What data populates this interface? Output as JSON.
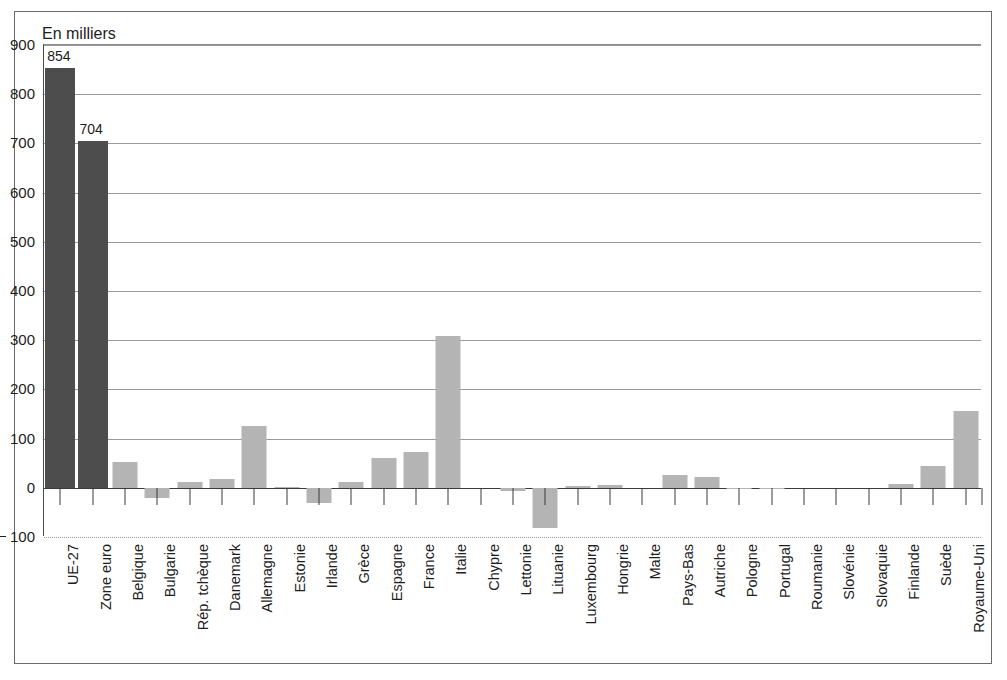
{
  "unit_caption": "En milliers",
  "colors": {
    "bar_dark": "#4d4d4d",
    "bar_light": "#b4b4b4",
    "axis": "#3b3b3b",
    "grid": "#9a9a9a",
    "frame": "#6a6a6a",
    "text": "#1d1d1d"
  },
  "chart_data": {
    "type": "bar",
    "title": "",
    "subtitle": "",
    "xlabel": "",
    "ylabel": "En milliers",
    "ylim": [
      -100,
      900
    ],
    "ytick_labels": [
      "900",
      "800",
      "700",
      "600",
      "500",
      "400",
      "300",
      "200",
      "100",
      "0",
      "100"
    ],
    "ytick_values": [
      900,
      800,
      700,
      600,
      500,
      400,
      300,
      200,
      100,
      0,
      -100
    ],
    "ytick_negative_flags": [
      false,
      false,
      false,
      false,
      false,
      false,
      false,
      false,
      false,
      false,
      true
    ],
    "grid": true,
    "legend": "none",
    "categories": [
      "UE-27",
      "Zone euro",
      "Belgique",
      "Bulgarie",
      "Rép. tchèque",
      "Danemark",
      "Allemagne",
      "Estonie",
      "Irlande",
      "Grèce",
      "Espagne",
      "France",
      "Italie",
      "Chypre",
      "Lettonie",
      "Lituanie",
      "Luxembourg",
      "Hongrie",
      "Malte",
      "Pays-Bas",
      "Autriche",
      "Pologne",
      "Portugal",
      "Roumanie",
      "Slovénie",
      "Slovaquie",
      "Finlande",
      "Suède",
      "Royaume-Uni"
    ],
    "values": [
      854,
      704,
      53,
      -21,
      11,
      18,
      126,
      1,
      -30,
      12,
      61,
      73,
      308,
      0,
      -7,
      -82,
      3,
      6,
      0,
      27,
      22,
      -3,
      -1,
      0,
      0,
      0,
      8,
      44,
      156
    ],
    "highlighted": [
      true,
      true,
      false,
      false,
      false,
      false,
      false,
      false,
      false,
      false,
      false,
      false,
      false,
      false,
      false,
      false,
      false,
      false,
      false,
      false,
      false,
      false,
      false,
      false,
      false,
      false,
      false,
      false,
      false
    ],
    "data_labels": [
      {
        "category": "UE-27",
        "text": "854"
      },
      {
        "category": "Zone euro",
        "text": "704"
      }
    ]
  }
}
